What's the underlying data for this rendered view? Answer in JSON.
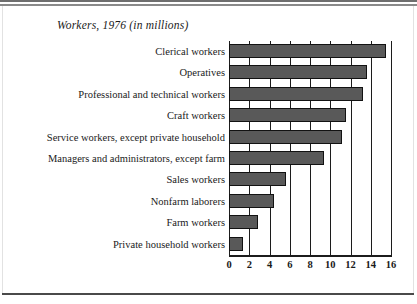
{
  "chart_data": {
    "type": "bar",
    "orientation": "horizontal",
    "title": "Workers, 1976 (in millions)",
    "xlabel": "",
    "ylabel": "",
    "xlim": [
      0,
      16
    ],
    "xticks": [
      0,
      2,
      4,
      6,
      8,
      10,
      12,
      14,
      16
    ],
    "tick_labels": [
      "0",
      "2",
      "4",
      "6",
      "8",
      "10",
      "12",
      "14",
      "16"
    ],
    "grid": "vertical",
    "legend": "none",
    "bar_color": "#595959",
    "bar_edge_color": "#121212",
    "categories": [
      "Clerical workers",
      "Operatives",
      "Professional and technical workers",
      "Craft workers",
      "Service workers, except private household",
      "Managers and administrators, except farm",
      "Sales workers",
      "Nonfarm laborers",
      "Farm workers",
      "Private household workers"
    ],
    "values": [
      15.5,
      13.6,
      13.2,
      11.6,
      11.2,
      9.4,
      5.6,
      4.4,
      2.9,
      1.4
    ],
    "units": "millions of workers"
  }
}
